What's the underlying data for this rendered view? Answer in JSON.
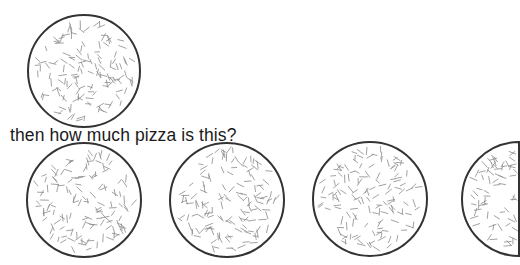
{
  "question": "then how much pizza is this?",
  "colors": {
    "outline": "#333333",
    "sprinkle": "#8a8a8a",
    "text": "#1a1a1a",
    "background": "#ffffff"
  },
  "pizzas": {
    "reference": {
      "label": "whole pizza",
      "fraction": 1,
      "cx": 84,
      "cy": 71,
      "r": 56
    },
    "group": [
      {
        "label": "whole pizza",
        "fraction": 1,
        "cx": 84,
        "cy": 200,
        "r": 57
      },
      {
        "label": "whole pizza",
        "fraction": 1,
        "cx": 227,
        "cy": 200,
        "r": 57
      },
      {
        "label": "whole pizza",
        "fraction": 1,
        "cx": 370,
        "cy": 199,
        "r": 57
      },
      {
        "label": "half pizza",
        "fraction": 0.5,
        "cx": 519,
        "cy": 199,
        "r": 57
      }
    ]
  }
}
